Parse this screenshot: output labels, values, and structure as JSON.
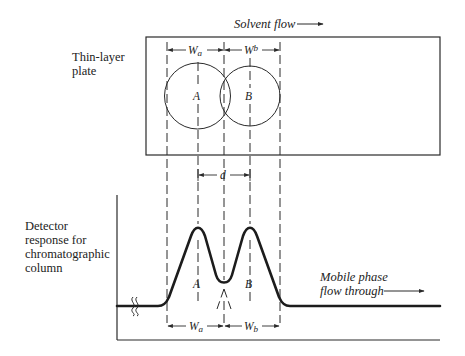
{
  "diagram": {
    "plate_label_line1": "Thin-layer",
    "plate_label_line2": "plate",
    "solvent_flow_label": "Solvent flow",
    "detector_label_lines": [
      "Detector",
      "response for",
      "chromatographic",
      "column"
    ],
    "mobile_phase_line1": "Mobile phase",
    "mobile_phase_line2": "flow through",
    "spot_a_label": "A",
    "spot_b_label": "B",
    "peak_a_label": "A",
    "peak_b_label": "B",
    "width_a_label": "W",
    "width_a_sub": "a",
    "width_b_label": "W",
    "width_b_sub": "b",
    "distance_label": "d"
  }
}
